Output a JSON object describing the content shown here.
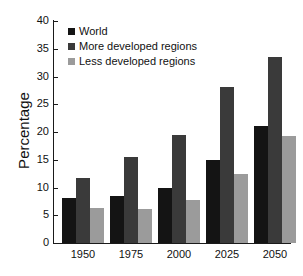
{
  "chart_data": {
    "type": "bar",
    "title": "",
    "xlabel": "",
    "ylabel": "Percentage",
    "categories": [
      "1950",
      "1975",
      "2000",
      "2025",
      "2050"
    ],
    "series": [
      {
        "name": "World",
        "color": "#141414",
        "values": [
          8.1,
          8.5,
          10.0,
          15.0,
          21.0
        ]
      },
      {
        "name": "More developed regions",
        "color": "#3a3a3a",
        "values": [
          11.7,
          15.5,
          19.4,
          28.2,
          33.5
        ]
      },
      {
        "name": "Less developed regions",
        "color": "#9b9b9b",
        "values": [
          6.3,
          6.2,
          7.7,
          12.5,
          19.3
        ]
      }
    ],
    "ylim": [
      0,
      40
    ],
    "yticks": [
      0,
      5,
      10,
      15,
      20,
      25,
      30,
      35,
      40
    ],
    "ytick_labels": [
      "0",
      "5",
      "10",
      "15",
      "20",
      "25",
      "30",
      "35",
      "40"
    ],
    "grid": false,
    "legend_position": "top-left",
    "legend_entries": [
      "World",
      "More developed regions",
      "Less developed regions"
    ]
  }
}
